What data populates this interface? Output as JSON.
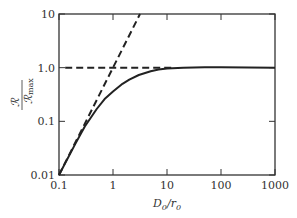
{
  "chart_data": {
    "type": "line",
    "title": "",
    "xlabel": "D0/r0",
    "ylabel": "R/Rmax",
    "xscale": "log",
    "yscale": "log",
    "xlim": [
      0.1,
      1000
    ],
    "ylim": [
      0.01,
      10
    ],
    "x_ticks": [
      "0.1",
      "1",
      "10",
      "100",
      "1000"
    ],
    "y_ticks": [
      "0.01",
      "0.1",
      "1.0",
      "10"
    ],
    "grid": false,
    "legend": null,
    "series": [
      {
        "name": "R/Rmax (solid)",
        "style": "solid",
        "x": [
          0.1,
          0.2,
          0.3,
          0.5,
          0.7,
          1,
          1.5,
          2,
          3,
          5,
          7,
          10,
          20,
          50,
          100,
          1000
        ],
        "y": [
          0.01,
          0.038,
          0.08,
          0.17,
          0.26,
          0.36,
          0.5,
          0.6,
          0.73,
          0.86,
          0.92,
          0.96,
          1.0,
          1.02,
          1.02,
          1.0
        ]
      },
      {
        "name": "asymptote slope 2 (dashed)",
        "style": "dashed",
        "x": [
          0.1,
          3.16
        ],
        "y": [
          0.01,
          10
        ]
      },
      {
        "name": "asymptote 1.0 (dashed)",
        "style": "dashed",
        "x": [
          0.13,
          12
        ],
        "y": [
          1.0,
          1.0
        ]
      }
    ]
  },
  "labels": {
    "x_axis": "D",
    "x_axis_sub": "0",
    "x_axis_div": "/r",
    "x_axis_sub2": "0",
    "y_num": "ℛ",
    "y_den": "ℛ",
    "y_den_sub": "max"
  }
}
